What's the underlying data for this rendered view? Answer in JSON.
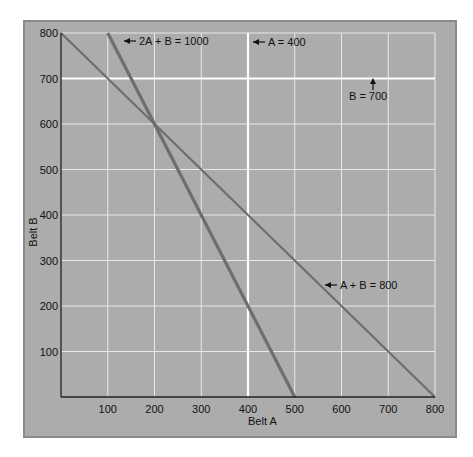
{
  "chart_data": {
    "type": "line",
    "title": "",
    "xlabel": "Belt A",
    "ylabel": "Belt B",
    "xlim": [
      0,
      800
    ],
    "ylim": [
      0,
      800
    ],
    "grid": true,
    "xticks": [
      "100",
      "200",
      "300",
      "400",
      "500",
      "600",
      "700",
      "800"
    ],
    "yticks": [
      "100",
      "200",
      "300",
      "400",
      "500",
      "600",
      "700",
      "800"
    ],
    "series": [
      {
        "name": "2A + B = 1000",
        "points": [
          [
            100,
            800
          ],
          [
            500,
            0
          ]
        ],
        "label": "2A + B = 1000",
        "style": "thick-line"
      },
      {
        "name": "A + B = 800",
        "points": [
          [
            0,
            800
          ],
          [
            800,
            0
          ]
        ],
        "label": "A + B = 800",
        "style": "line"
      },
      {
        "name": "A = 400",
        "points": [
          [
            400,
            0
          ],
          [
            400,
            800
          ]
        ],
        "label": "A = 400",
        "style": "highlight-gridline"
      },
      {
        "name": "B = 700",
        "points": [
          [
            0,
            700
          ],
          [
            800,
            700
          ]
        ],
        "label": "B = 700",
        "style": "highlight-gridline"
      }
    ],
    "annotations": [
      {
        "text": "2A + B = 1000",
        "arrow": "left"
      },
      {
        "text": "A = 400",
        "arrow": "left"
      },
      {
        "text": "B = 700",
        "arrow": "up"
      },
      {
        "text": "A + B = 800",
        "arrow": "left"
      }
    ],
    "intersection": {
      "A": 200,
      "B": 600
    },
    "colors": {
      "background": "#acacac",
      "gridline": "#e8e8e8",
      "highlight_line": "#ffffff",
      "constraint_line": "#6e6e6e",
      "axis": "#222222",
      "frame_border": "#8a8a8a"
    }
  }
}
